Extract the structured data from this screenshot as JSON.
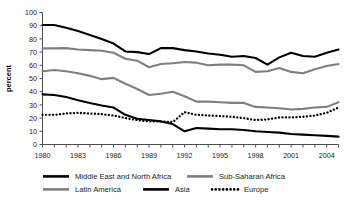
{
  "chart_data": {
    "type": "line",
    "title": "",
    "xlabel": "",
    "ylabel": "percent",
    "ylim": [
      0,
      100
    ],
    "xlim": [
      1980,
      2005
    ],
    "grid": false,
    "legend_position": "bottom",
    "y_ticks": [
      "0",
      "10",
      "20",
      "30",
      "40",
      "50",
      "60",
      "70",
      "80",
      "90",
      "100"
    ],
    "x_ticks": [
      "1980",
      "1983",
      "1986",
      "1989",
      "1992",
      "1995",
      "1998",
      "2001",
      "2004"
    ],
    "x_all_years": [
      1980,
      1981,
      1982,
      1983,
      1984,
      1985,
      1986,
      1987,
      1988,
      1989,
      1990,
      1991,
      1992,
      1993,
      1994,
      1995,
      1996,
      1997,
      1998,
      1999,
      2000,
      2001,
      2002,
      2003,
      2004,
      2005
    ],
    "series": [
      {
        "name": "Middle East and North Africa",
        "color": "#000000",
        "style": "solid",
        "width": 2.1,
        "values": [
          90.5,
          90.5,
          88.5,
          86.0,
          83.0,
          80.0,
          76.5,
          70.5,
          70.0,
          68.5,
          73.0,
          73.0,
          71.5,
          70.5,
          69.0,
          68.0,
          66.5,
          67.0,
          65.5,
          60.5,
          66.0,
          69.5,
          67.0,
          66.5,
          69.5,
          72.0
        ]
      },
      {
        "name": "Sub-Saharan Africa",
        "color": "#7f7f7f",
        "style": "solid",
        "width": 2.1,
        "values": [
          72.8,
          72.8,
          73.0,
          72.0,
          71.5,
          71.0,
          69.5,
          65.0,
          63.5,
          58.5,
          61.0,
          61.5,
          62.5,
          62.0,
          60.0,
          60.5,
          60.5,
          60.0,
          55.0,
          55.5,
          58.0,
          55.0,
          54.0,
          57.0,
          59.5,
          61.0
        ]
      },
      {
        "name": "Latin America",
        "color": "#7f7f7f",
        "style": "solid",
        "width": 2.1,
        "values": [
          55.5,
          56.5,
          55.5,
          54.0,
          52.0,
          49.5,
          50.5,
          46.0,
          42.0,
          37.5,
          38.5,
          40.0,
          36.5,
          32.5,
          32.5,
          32.0,
          31.5,
          31.5,
          28.5,
          28.0,
          27.5,
          26.5,
          27.0,
          28.0,
          28.5,
          32.0
        ]
      },
      {
        "name": "Asia",
        "color": "#000000",
        "style": "solid",
        "width": 2.1,
        "values": [
          38.0,
          37.5,
          36.0,
          33.5,
          31.5,
          29.5,
          28.0,
          22.5,
          19.5,
          18.5,
          17.5,
          15.5,
          10.0,
          12.5,
          12.0,
          11.5,
          11.5,
          11.0,
          10.0,
          9.5,
          9.0,
          8.0,
          7.5,
          7.0,
          6.5,
          6.0
        ]
      },
      {
        "name": "Europe",
        "color": "#000000",
        "style": "dotted",
        "width": 2.3,
        "values": [
          22.5,
          22.5,
          23.5,
          24.0,
          23.5,
          23.0,
          22.0,
          20.0,
          18.5,
          17.5,
          17.5,
          17.0,
          24.5,
          22.5,
          22.0,
          21.5,
          21.0,
          20.0,
          18.5,
          19.0,
          20.5,
          20.5,
          21.0,
          22.0,
          24.0,
          28.0
        ]
      }
    ],
    "legend": [
      {
        "label": "Middle East and North Africa",
        "color": "#000000",
        "style": "solid"
      },
      {
        "label": "Sub-Saharan Africa",
        "color": "#7f7f7f",
        "style": "solid"
      },
      {
        "label": "Latin America",
        "color": "#7f7f7f",
        "style": "solid"
      },
      {
        "label": "Asia",
        "color": "#000000",
        "style": "solid"
      },
      {
        "label": "Europe",
        "color": "#000000",
        "style": "dotted"
      }
    ]
  }
}
